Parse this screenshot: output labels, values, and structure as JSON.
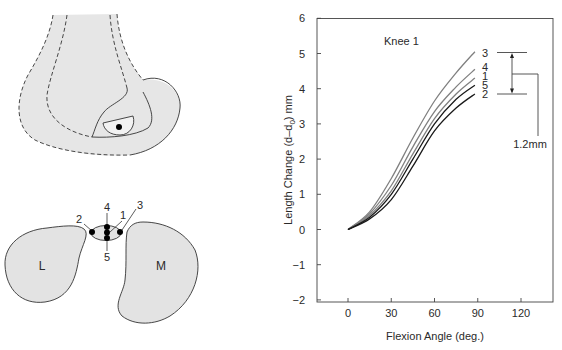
{
  "figure": {
    "femur_diagram": {
      "description": "Lateral view of distal femur with ligament insertion region"
    },
    "cross_section": {
      "lateral_label": "L",
      "medial_label": "M",
      "point_labels": [
        "1",
        "2",
        "3",
        "4",
        "5"
      ]
    },
    "annotation": {
      "range_label": "1.2mm"
    }
  },
  "chart_data": {
    "type": "line",
    "title": "Knee 1",
    "xlabel": "Flexion Angle (deg.)",
    "ylabel": "Length Change (d–d₀) mm",
    "ylabel_main": "Length Change (d–d",
    "ylabel_sub": "0",
    "ylabel_end": ") mm",
    "xlim": [
      -21,
      142
    ],
    "ylim": [
      -2,
      6
    ],
    "xticks": [
      0,
      30,
      60,
      90,
      120
    ],
    "yticks": [
      -2,
      -1,
      0,
      1,
      2,
      3,
      4,
      5,
      6
    ],
    "ytick_labels": [
      "−2",
      "−1",
      "0",
      "1",
      "2",
      "3",
      "4",
      "5",
      "6"
    ],
    "grid": false,
    "legend": "inline end labels",
    "x": [
      0,
      15,
      30,
      45,
      60,
      75,
      88
    ],
    "series": [
      {
        "name": "3",
        "color": "#808080",
        "values": [
          0.0,
          0.5,
          1.45,
          2.6,
          3.65,
          4.45,
          5.05
        ]
      },
      {
        "name": "4",
        "color": "#808080",
        "values": [
          0.0,
          0.45,
          1.25,
          2.35,
          3.35,
          4.05,
          4.55
        ]
      },
      {
        "name": "1",
        "color": "#808080",
        "values": [
          0.0,
          0.4,
          1.1,
          2.15,
          3.15,
          3.85,
          4.3
        ]
      },
      {
        "name": "5",
        "color": "#1a1a1a",
        "values": [
          0.0,
          0.35,
          1.0,
          2.0,
          3.0,
          3.7,
          4.1
        ]
      },
      {
        "name": "2",
        "color": "#1a1a1a",
        "values": [
          0.0,
          0.3,
          0.85,
          1.8,
          2.8,
          3.45,
          3.85
        ]
      }
    ],
    "annotations": [
      {
        "type": "range-bracket",
        "from": 3.85,
        "to": 5.05,
        "label": "1.2mm"
      }
    ]
  }
}
